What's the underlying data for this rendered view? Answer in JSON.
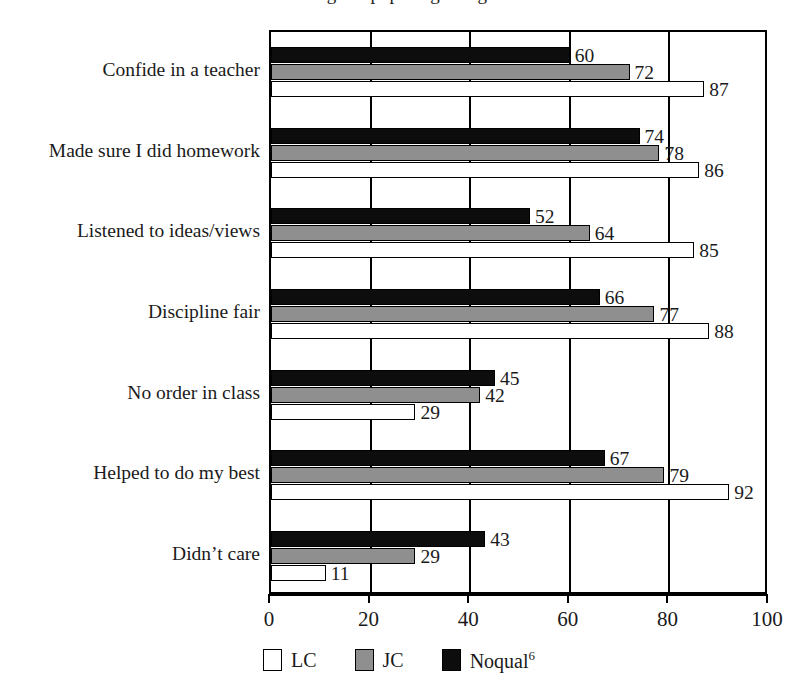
{
  "title_fragment": "Figure: pupils agreeing",
  "chart_data": {
    "type": "bar",
    "orientation": "horizontal",
    "title": "",
    "xlabel": "",
    "ylabel": "",
    "xlim": [
      0,
      100
    ],
    "xticks": [
      0,
      20,
      40,
      60,
      80,
      100
    ],
    "grid": true,
    "legend_position": "bottom",
    "categories": [
      "Confide in a teacher",
      "Made sure I did homework",
      "Listened to ideas/views",
      "Discipline fair",
      "No order in class",
      "Helped to do my best",
      "Didn’t care"
    ],
    "series": [
      {
        "name": "LC",
        "color": "#ffffff",
        "values": [
          87,
          86,
          85,
          88,
          29,
          92,
          11
        ]
      },
      {
        "name": "JC",
        "color": "#8f8f8f",
        "values": [
          72,
          78,
          64,
          77,
          42,
          79,
          29
        ]
      },
      {
        "name": "Noqual",
        "color": "#0d0d0d",
        "values": [
          60,
          74,
          52,
          66,
          45,
          67,
          43
        ]
      }
    ]
  },
  "legend": {
    "items": [
      {
        "label": "LC",
        "sup": "",
        "swatch": "lc"
      },
      {
        "label": "JC",
        "sup": "",
        "swatch": "jc"
      },
      {
        "label": "Noqual",
        "sup": "6",
        "swatch": "noqual"
      }
    ]
  }
}
